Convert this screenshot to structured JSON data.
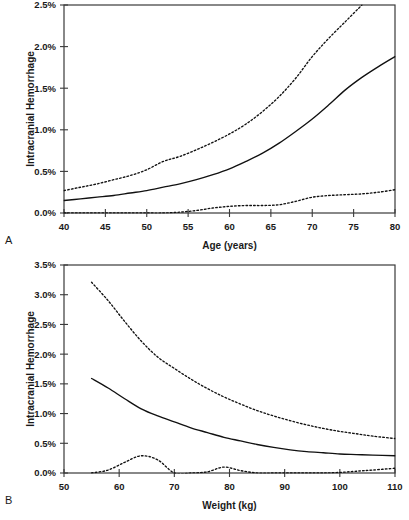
{
  "figure": {
    "panel_a_letter": "A",
    "panel_b_letter": "B"
  },
  "chart_data": [
    {
      "id": "panel-a",
      "type": "line",
      "title": "",
      "panel_label": "A",
      "xlabel": "Age (years)",
      "ylabel": "Intracranial Hemorrhage",
      "xlim": [
        40,
        80
      ],
      "ylim": [
        0,
        2.5
      ],
      "xticks": [
        40,
        45,
        50,
        55,
        60,
        65,
        70,
        75,
        80
      ],
      "xtick_labels": [
        "40",
        "45",
        "50",
        "55",
        "60",
        "65",
        "70",
        "75",
        "80"
      ],
      "yticks": [
        0.0,
        0.5,
        1.0,
        1.5,
        2.0,
        2.5
      ],
      "ytick_labels": [
        "0.0%",
        "0.5%",
        "1.0%",
        "1.5%",
        "2.0%",
        "2.5%"
      ],
      "grid": false,
      "legend": "none",
      "x": [
        40,
        42,
        44,
        46,
        48,
        50,
        52,
        54,
        56,
        58,
        60,
        62,
        64,
        66,
        68,
        70,
        72,
        74,
        76,
        78,
        80
      ],
      "series": [
        {
          "name": "Upper 95% confidence limit",
          "style": "dashed",
          "values": [
            0.27,
            0.31,
            0.35,
            0.4,
            0.45,
            0.52,
            0.62,
            0.68,
            0.76,
            0.85,
            0.95,
            1.07,
            1.22,
            1.4,
            1.62,
            1.88,
            2.1,
            2.3,
            2.52,
            null,
            null
          ],
          "clipped_at_top": true,
          "note": "Exits top of plot near age 76 at 2.5%"
        },
        {
          "name": "Predicted probability",
          "style": "solid",
          "values": [
            0.15,
            0.17,
            0.19,
            0.21,
            0.24,
            0.27,
            0.31,
            0.35,
            0.4,
            0.46,
            0.53,
            0.62,
            0.72,
            0.84,
            0.98,
            1.13,
            1.3,
            1.48,
            1.63,
            1.76,
            1.88
          ]
        },
        {
          "name": "Lower 95% confidence limit",
          "style": "dashed",
          "values": [
            0.0,
            0.0,
            0.0,
            0.0,
            0.0,
            0.0,
            0.0,
            0.01,
            0.03,
            0.06,
            0.08,
            0.09,
            0.09,
            0.1,
            0.14,
            0.19,
            0.21,
            0.22,
            0.23,
            0.25,
            0.28
          ]
        }
      ]
    },
    {
      "id": "panel-b",
      "type": "line",
      "title": "",
      "panel_label": "B",
      "xlabel": "Weight (kg)",
      "ylabel": "Intracranial Hemorrhage",
      "xlim": [
        50,
        110
      ],
      "ylim": [
        0,
        3.5
      ],
      "xticks": [
        50,
        60,
        70,
        80,
        90,
        100,
        110
      ],
      "xtick_labels": [
        "50",
        "60",
        "70",
        "80",
        "90",
        "100",
        "110"
      ],
      "yticks": [
        0.0,
        0.5,
        1.0,
        1.5,
        2.0,
        2.5,
        3.0,
        3.5
      ],
      "ytick_labels": [
        "0.0%",
        "0.5%",
        "1.0%",
        "1.5%",
        "2.0%",
        "2.5%",
        "3.0%",
        "3.5%"
      ],
      "grid": false,
      "legend": "none",
      "x": [
        55,
        58,
        61,
        64,
        67,
        70,
        73,
        76,
        79,
        82,
        85,
        88,
        91,
        94,
        97,
        100,
        103,
        106,
        110
      ],
      "series": [
        {
          "name": "Upper 95% confidence limit",
          "style": "dashed",
          "values": [
            3.21,
            2.9,
            2.55,
            2.22,
            1.95,
            1.76,
            1.58,
            1.42,
            1.28,
            1.16,
            1.05,
            0.96,
            0.88,
            0.81,
            0.75,
            0.7,
            0.66,
            0.62,
            0.58
          ],
          "starts_at": 55
        },
        {
          "name": "Predicted probability",
          "style": "solid",
          "values": [
            1.59,
            1.43,
            1.25,
            1.08,
            0.96,
            0.86,
            0.76,
            0.68,
            0.6,
            0.54,
            0.48,
            0.43,
            0.39,
            0.36,
            0.34,
            0.32,
            0.31,
            0.3,
            0.29
          ],
          "starts_at": 55
        },
        {
          "name": "Lower 95% confidence limit",
          "style": "dashed",
          "values": [
            0.0,
            0.05,
            0.18,
            0.29,
            0.22,
            0.0,
            0.0,
            0.02,
            0.1,
            0.04,
            0.0,
            0.0,
            0.0,
            0.0,
            0.0,
            0.01,
            0.03,
            0.05,
            0.08
          ],
          "starts_at": 50,
          "note": "Flat at zero from 50 to ~56, bump peaking ~0.30% near 64 kg, second bump ~0.10% near 80 kg, slow rise after 100 kg"
        }
      ]
    }
  ]
}
